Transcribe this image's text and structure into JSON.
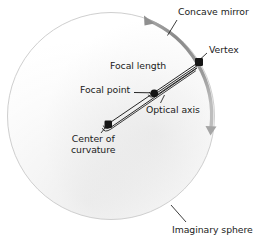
{
  "figure": {
    "background_color": "#ffffff",
    "ink_color": "#1b1b1b",
    "sphere_outline_color": "#cfcfcf",
    "sphere_fill_color": "#f7f7f7",
    "mirror_arc_color": "#8c8c8c",
    "width": 260,
    "height": 243
  },
  "labels": {
    "concave_mirror": "Concave mirror",
    "vertex": "Vertex",
    "focal_length": "Focal length",
    "focal_point": "Focal point",
    "optical_axis": "Optical axis",
    "center_of_curvature_line1": "Center of",
    "center_of_curvature_line2": "curvature",
    "imaginary_sphere": "Imaginary sphere"
  },
  "geometry": {
    "sphere": {
      "cx": 111,
      "cy": 116,
      "r": 104
    },
    "points": [
      {
        "name": "vertex",
        "x": 199,
        "y": 62
      },
      {
        "name": "focal-point",
        "x": 154,
        "y": 93
      },
      {
        "name": "center-of-curvature",
        "x": 108,
        "y": 124
      }
    ],
    "mirror_arc": {
      "start_x": 146,
      "start_y": 17,
      "end_x": 212,
      "end_y": 130,
      "double_headed": true
    },
    "optical_axis": {
      "from": "center-of-curvature",
      "to": "vertex"
    }
  }
}
